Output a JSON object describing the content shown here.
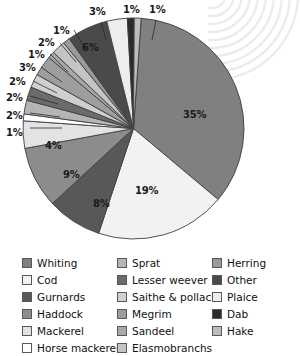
{
  "chart_data": {
    "type": "pie",
    "title": "",
    "xlabel": "",
    "ylabel": "",
    "unit": "%",
    "legend_position": "bottom",
    "grid": false,
    "categories": [
      "Whiting",
      "Cod",
      "Gurnards",
      "Haddock",
      "Mackerel",
      "Horse mackerel",
      "Sprat",
      "Lesser weever",
      "Saithe & pollack",
      "Megrim",
      "Sandeel",
      "Elasmobranchs",
      "Herring",
      "Other",
      "Plaice",
      "Dab",
      "Hake"
    ],
    "values": [
      35,
      19,
      8,
      9,
      4,
      1,
      2,
      2,
      2,
      3,
      1,
      2,
      1,
      6,
      3,
      1,
      1
    ],
    "colors": [
      "#808080",
      "#f2f2f2",
      "#585858",
      "#8c8c8c",
      "#e3e3e3",
      "#ffffff",
      "#b5b5b5",
      "#6b6b6b",
      "#cfcfcf",
      "#9e9e9e",
      "#a8a8a8",
      "#c4c4c4",
      "#9a9a9a",
      "#4a4a4a",
      "#ededed",
      "#2b2b2b",
      "#bdbdbd"
    ],
    "slice_labels": [
      "35%",
      "19%",
      "8%",
      "9%",
      "4%",
      "1%",
      "2%",
      "2%",
      "2%",
      "3%",
      "1%",
      "2%",
      "1%",
      "6%",
      "3%",
      "1%",
      "1%"
    ]
  },
  "legend": {
    "columns": [
      {
        "items": [
          {
            "label": "Whiting"
          },
          {
            "label": "Cod"
          },
          {
            "label": "Gurnards"
          },
          {
            "label": "Haddock"
          },
          {
            "label": "Mackerel"
          },
          {
            "label": "Horse mackerel"
          }
        ]
      },
      {
        "items": [
          {
            "label": "Sprat"
          },
          {
            "label": "Lesser weever"
          },
          {
            "label": "Saithe & pollack"
          },
          {
            "label": "Megrim"
          },
          {
            "label": "Sandeel"
          },
          {
            "label": "Elasmobranchs"
          }
        ]
      },
      {
        "items": [
          {
            "label": "Herring"
          },
          {
            "label": "Other"
          },
          {
            "label": "Plaice"
          },
          {
            "label": "Dab"
          },
          {
            "label": "Hake"
          }
        ]
      }
    ]
  },
  "slice_callouts": [
    {
      "text": "35%",
      "x": 183,
      "y": 110
    },
    {
      "text": "19%",
      "x": 135,
      "y": 186
    },
    {
      "text": "8%",
      "x": 93,
      "y": 199
    },
    {
      "text": "9%",
      "x": 63,
      "y": 170
    },
    {
      "text": "4%",
      "x": 45,
      "y": 141
    },
    {
      "text": "1%",
      "x": 6,
      "y": 128
    },
    {
      "text": "2%",
      "x": 6,
      "y": 111
    },
    {
      "text": "2%",
      "x": 6,
      "y": 93
    },
    {
      "text": "2%",
      "x": 9,
      "y": 77
    },
    {
      "text": "3%",
      "x": 19,
      "y": 63
    },
    {
      "text": "1%",
      "x": 28,
      "y": 50
    },
    {
      "text": "2%",
      "x": 38,
      "y": 38
    },
    {
      "text": "1%",
      "x": 53,
      "y": 26
    },
    {
      "text": "6%",
      "x": 82,
      "y": 43
    },
    {
      "text": "3%",
      "x": 89,
      "y": 7
    },
    {
      "text": "1%",
      "x": 123,
      "y": 5
    },
    {
      "text": "1%",
      "x": 149,
      "y": 5
    }
  ]
}
